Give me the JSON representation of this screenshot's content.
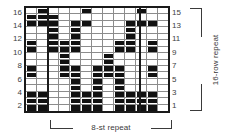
{
  "chart_data": {
    "type": "heatmap",
    "title": "",
    "xlabel": "8-st repeat",
    "ylabel": "16-row repeat",
    "columns": 13,
    "rows": 16,
    "grid_note": "1 = filled (dark) stitch symbol, 0 = empty (blank) stitch",
    "row_labels_left": [
      "16",
      "14",
      "12",
      "10",
      "8",
      "6",
      "4",
      "2"
    ],
    "row_labels_right": [
      "15",
      "13",
      "11",
      "9",
      "7",
      "5",
      "3",
      "1"
    ],
    "repeat_boundaries_after_column": [
      2,
      10
    ],
    "colors": {
      "filled": "#111111",
      "empty": "#ffffff",
      "gridline": "#8c8c8c",
      "border": "#1a1a1a",
      "label": "#404040",
      "bracket": "#3a3a3a"
    },
    "rows_top_to_bottom": [
      {
        "row": 16,
        "cells": [
          0,
          1,
          0,
          0,
          0,
          1,
          0,
          0,
          0,
          0,
          1,
          0,
          0
        ]
      },
      {
        "row": 15,
        "cells": [
          1,
          1,
          1,
          0,
          0,
          0,
          0,
          0,
          0,
          0,
          0,
          0,
          0
        ]
      },
      {
        "row": 14,
        "cells": [
          1,
          1,
          1,
          0,
          1,
          1,
          0,
          0,
          0,
          1,
          1,
          1,
          0
        ]
      },
      {
        "row": 13,
        "cells": [
          0,
          0,
          1,
          0,
          1,
          0,
          0,
          0,
          0,
          1,
          0,
          0,
          0
        ]
      },
      {
        "row": 12,
        "cells": [
          0,
          0,
          1,
          0,
          1,
          0,
          0,
          0,
          0,
          1,
          0,
          0,
          0
        ]
      },
      {
        "row": 11,
        "cells": [
          1,
          0,
          1,
          1,
          1,
          0,
          0,
          0,
          1,
          1,
          0,
          1,
          0
        ]
      },
      {
        "row": 10,
        "cells": [
          1,
          0,
          1,
          1,
          1,
          0,
          0,
          0,
          1,
          1,
          0,
          1,
          0
        ]
      },
      {
        "row": 9,
        "cells": [
          0,
          0,
          0,
          1,
          0,
          0,
          0,
          1,
          0,
          0,
          0,
          0,
          0
        ]
      },
      {
        "row": 8,
        "cells": [
          0,
          0,
          0,
          1,
          0,
          0,
          0,
          1,
          0,
          0,
          0,
          0,
          0
        ]
      },
      {
        "row": 7,
        "cells": [
          1,
          0,
          0,
          1,
          1,
          0,
          1,
          1,
          1,
          0,
          0,
          1,
          0
        ]
      },
      {
        "row": 6,
        "cells": [
          1,
          0,
          0,
          1,
          1,
          0,
          1,
          1,
          1,
          0,
          0,
          1,
          0
        ]
      },
      {
        "row": 5,
        "cells": [
          0,
          0,
          0,
          0,
          1,
          0,
          1,
          0,
          1,
          0,
          0,
          0,
          0
        ]
      },
      {
        "row": 4,
        "cells": [
          0,
          0,
          0,
          0,
          1,
          0,
          1,
          0,
          1,
          0,
          0,
          0,
          0
        ]
      },
      {
        "row": 3,
        "cells": [
          1,
          1,
          0,
          0,
          1,
          1,
          1,
          0,
          1,
          1,
          1,
          1,
          0
        ]
      },
      {
        "row": 2,
        "cells": [
          1,
          1,
          0,
          0,
          1,
          1,
          1,
          0,
          1,
          1,
          1,
          1,
          0
        ]
      },
      {
        "row": 1,
        "cells": [
          1,
          1,
          0,
          0,
          1,
          1,
          1,
          0,
          1,
          1,
          1,
          1,
          0
        ]
      }
    ]
  },
  "labels": {
    "row_repeat": "16-row repeat",
    "stitch_repeat": "8-st repeat"
  }
}
